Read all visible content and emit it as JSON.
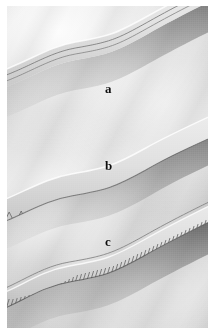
{
  "figure": {
    "kind": "photograph",
    "background_color": "#ffffff",
    "photo_tone": "grayscale",
    "cloth_color": "#d6d6d6",
    "label_color": "#0d0d0d"
  },
  "labels": [
    {
      "id": "a",
      "text": "a",
      "seam_name": "plain straight stitch seam",
      "description": "two fine parallel rows of straight stitching along a pressed edge"
    },
    {
      "id": "b",
      "text": "b",
      "seam_name": "zigzag finished edge",
      "description": "open zigzag stitch worked over a folded raw edge"
    },
    {
      "id": "c",
      "text": "c",
      "seam_name": "overlock serged edge",
      "description": "dense closely spaced overlock threads wrapping the fabric edge"
    }
  ],
  "seams": [
    {
      "id": "a",
      "stitch_type": "straight",
      "thread_rows": 2,
      "edge": "pressed fold"
    },
    {
      "id": "b",
      "stitch_type": "zigzag",
      "thread_rows": 1,
      "edge": "folded hem"
    },
    {
      "id": "c",
      "stitch_type": "overlock",
      "thread_rows": 1,
      "edge": "serged raw edge"
    }
  ]
}
